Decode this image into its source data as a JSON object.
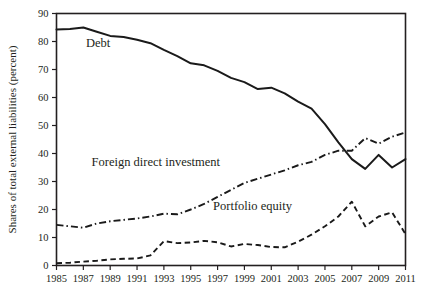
{
  "chart_data": {
    "type": "line",
    "title": "",
    "xlabel": "",
    "ylabel": "Shares of total external liabilities (percent)",
    "xlim": [
      1985,
      2011
    ],
    "ylim": [
      0,
      90
    ],
    "yticks": [
      0,
      10,
      20,
      30,
      40,
      50,
      60,
      70,
      80,
      90
    ],
    "xticks": [
      1985,
      1987,
      1989,
      1991,
      1993,
      1995,
      1997,
      1999,
      2001,
      2003,
      2005,
      2007,
      2009,
      2011
    ],
    "xtick_labels": [
      "1985",
      "1987",
      "1989",
      "1991",
      "1993",
      "1995",
      "1997",
      "1999",
      "2001",
      "2003",
      "2005",
      "2007",
      "2009",
      "2011"
    ],
    "ytick_labels": [
      "0",
      "10",
      "20",
      "30",
      "40",
      "50",
      "60",
      "70",
      "80",
      "90"
    ],
    "grid": false,
    "legend_position": "inline-annotations",
    "x": [
      1985,
      1986,
      1987,
      1988,
      1989,
      1990,
      1991,
      1992,
      1993,
      1994,
      1995,
      1996,
      1997,
      1998,
      1999,
      2000,
      2001,
      2002,
      2003,
      2004,
      2005,
      2006,
      2007,
      2008,
      2009,
      2010,
      2011
    ],
    "series": [
      {
        "name": "Debt",
        "style": "solid",
        "label_x": 1988.1,
        "label_y": 78.0,
        "values": [
          84.3,
          84.5,
          85.0,
          83.5,
          82.0,
          81.6,
          80.6,
          79.4,
          77.0,
          74.8,
          72.2,
          71.5,
          69.5,
          67.0,
          65.5,
          63.0,
          63.5,
          61.5,
          58.5,
          56.0,
          50.5,
          44.0,
          38.0,
          34.5,
          39.5,
          35.0,
          38.0
        ]
      },
      {
        "name": "Foreign direct investment",
        "style": "dash-dot",
        "label_x": 1992.4,
        "label_y": 35.5,
        "values": [
          14.5,
          14.0,
          13.5,
          15.0,
          15.8,
          16.3,
          16.8,
          17.5,
          18.5,
          18.3,
          20.0,
          22.0,
          24.5,
          27.0,
          29.5,
          31.0,
          32.5,
          34.0,
          35.8,
          37.0,
          39.5,
          41.0,
          41.0,
          45.5,
          43.5,
          46.0,
          47.5
        ]
      },
      {
        "name": "Portfolio equity",
        "style": "dashed",
        "label_x": 1999.6,
        "label_y": 20.0,
        "values": [
          0.8,
          1.0,
          1.4,
          1.7,
          2.2,
          2.4,
          2.5,
          3.6,
          8.7,
          8.0,
          8.2,
          8.8,
          8.3,
          6.8,
          7.7,
          7.3,
          6.6,
          6.5,
          8.5,
          11.0,
          14.0,
          17.5,
          22.8,
          14.0,
          17.5,
          19.0,
          11.2
        ]
      }
    ]
  },
  "footer": {
    "partial_caption": ""
  }
}
